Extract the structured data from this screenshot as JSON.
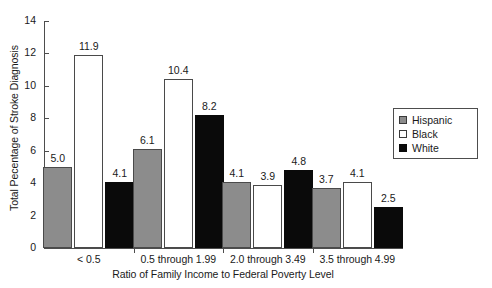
{
  "chart_data": {
    "type": "bar",
    "title": "",
    "subtitle": "",
    "xlabel": "Ratio of Family Income to Federal Poverty Level",
    "ylabel": "Total Pecentage of Stroke Diagnosis",
    "categories": [
      "< 0.5",
      "0.5 through 1.99",
      "2.0 through 3.49",
      "3.5 through 4.99"
    ],
    "series": [
      {
        "name": "Hispanic",
        "color": "#8c8c8c",
        "values": [
          5.0,
          6.1,
          4.1,
          3.7
        ],
        "labels": [
          "5.0",
          "6.1",
          "4.1",
          "3.7"
        ]
      },
      {
        "name": "Black",
        "color": "#ffffff",
        "values": [
          11.9,
          10.4,
          3.9,
          4.1
        ],
        "labels": [
          "11.9",
          "10.4",
          "3.9",
          "4.1"
        ]
      },
      {
        "name": "White",
        "color": "#000000",
        "values": [
          4.1,
          8.2,
          4.8,
          2.5
        ],
        "labels": [
          "4.1",
          "8.2",
          "4.8",
          "2.5"
        ]
      }
    ],
    "ylim": [
      0,
      14
    ],
    "yticks": [
      "0",
      "2",
      "4",
      "6",
      "8",
      "10",
      "12",
      "14"
    ],
    "grid": false,
    "legend_position": "right"
  },
  "legend": {
    "items": [
      {
        "label": "Hispanic"
      },
      {
        "label": "Black"
      },
      {
        "label": "White"
      }
    ]
  }
}
